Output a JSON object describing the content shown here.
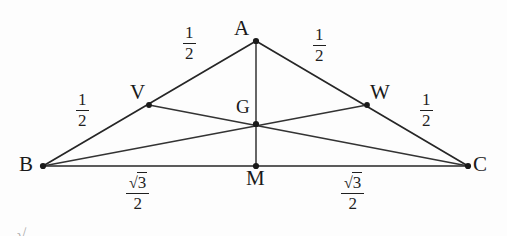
{
  "figure": {
    "background_color": "#fdfdfd",
    "stroke_color": "#262626",
    "text_color": "#1a1a1a"
  },
  "points": {
    "A": {
      "label": "A",
      "x": 256,
      "y": 41,
      "label_x": 234,
      "label_y": 18
    },
    "B": {
      "label": "B",
      "x": 43,
      "y": 166,
      "label_x": 19,
      "label_y": 154
    },
    "C": {
      "label": "C",
      "x": 468,
      "y": 166,
      "label_x": 473,
      "label_y": 154
    },
    "V": {
      "label": "V",
      "x": 149,
      "y": 105,
      "label_x": 130,
      "label_y": 82
    },
    "W": {
      "label": "W",
      "x": 367,
      "y": 105,
      "label_x": 370,
      "label_y": 82
    },
    "G": {
      "label": "G",
      "x": 256,
      "y": 124,
      "label_x": 236,
      "label_y": 97
    },
    "M": {
      "label": "M",
      "x": 256,
      "y": 166,
      "label_x": 246,
      "label_y": 168
    }
  },
  "segments": [
    {
      "name": "side-AB",
      "from": "A",
      "to": "B"
    },
    {
      "name": "side-AC",
      "from": "A",
      "to": "C"
    },
    {
      "name": "side-BC",
      "from": "B",
      "to": "C"
    },
    {
      "name": "median-AM",
      "from": "A",
      "to": "M"
    },
    {
      "name": "cevian-BW",
      "from": "B",
      "to": "W"
    },
    {
      "name": "cevian-CV",
      "from": "C",
      "to": "V"
    }
  ],
  "length_labels": [
    {
      "name": "length-AV",
      "segment": "AV",
      "numerator": "1",
      "denominator": "2",
      "has_radical": false,
      "x": 183,
      "y": 24
    },
    {
      "name": "length-AW",
      "segment": "AW",
      "numerator": "1",
      "denominator": "2",
      "has_radical": false,
      "x": 313,
      "y": 26
    },
    {
      "name": "length-BV",
      "segment": "BV",
      "numerator": "1",
      "denominator": "2",
      "has_radical": false,
      "x": 76,
      "y": 91
    },
    {
      "name": "length-WC",
      "segment": "WC",
      "numerator": "1",
      "denominator": "2",
      "has_radical": false,
      "x": 420,
      "y": 91
    },
    {
      "name": "length-BM",
      "segment": "BM",
      "numerator": "3",
      "denominator": "2",
      "has_radical": true,
      "x": 126,
      "y": 174
    },
    {
      "name": "length-MC",
      "segment": "MC",
      "numerator": "3",
      "denominator": "2",
      "has_radical": true,
      "x": 341,
      "y": 174
    }
  ],
  "artifact": {
    "name": "cropped-radical-artifact",
    "glyph": "√"
  }
}
